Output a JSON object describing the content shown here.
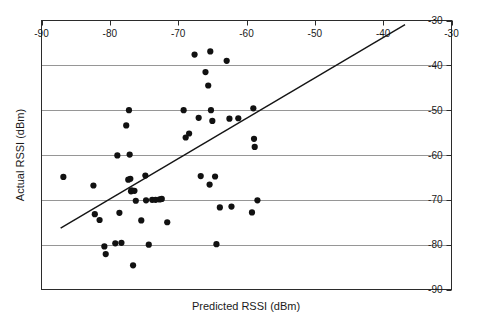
{
  "chart_data": {
    "type": "scatter",
    "title": "",
    "xlabel": "Predicted RSSI (dBm)",
    "ylabel": "Actual RSSI (dBm)",
    "xlim": [
      -90,
      -30
    ],
    "ylim": [
      -90,
      -30
    ],
    "xticks": [
      -90,
      -80,
      -70,
      -60,
      -50,
      -40,
      -30
    ],
    "xtick_labels": [
      "-90",
      "-80",
      "-70",
      "-60",
      "-50",
      "-40",
      "-30"
    ],
    "yticks": [
      -30,
      -40,
      -50,
      -60,
      -70,
      -80,
      -90
    ],
    "ytick_labels": [
      "-30",
      "-40",
      "-50",
      "-60",
      "-70",
      "-80",
      "-90"
    ],
    "xaxis_position": "top",
    "yaxis_position": "right",
    "grid": "horizontal",
    "grid_color": "#8a8a8a",
    "frame_color": "#2b2b2b",
    "marker_color": "#111111",
    "marker_shape": "circle",
    "marker_size": 3.1,
    "legend": null,
    "series": [
      {
        "name": "RSSI samples",
        "x": [
          -86.8,
          -82.4,
          -82.2,
          -81.5,
          -80.8,
          -80.6,
          -79.2,
          -78.9,
          -78.6,
          -78.3,
          -77.6,
          -77.3,
          -77.2,
          -77.1,
          -77.0,
          -76.9,
          -76.8,
          -76.6,
          -76.4,
          -76.2,
          -75.4,
          -74.8,
          -74.7,
          -74.3,
          -73.8,
          -73.3,
          -72.7,
          -72.4,
          -71.6,
          -69.2,
          -68.9,
          -68.4,
          -67.6,
          -67.0,
          -66.7,
          -66.0,
          -65.6,
          -65.4,
          -65.3,
          -65.2,
          -65.0,
          -64.6,
          -64.4,
          -63.9,
          -62.9,
          -62.5,
          -62.2,
          -61.2,
          -59.2,
          -59.0,
          -58.9,
          -58.8,
          -58.4
        ],
        "y": [
          -64.9,
          -66.8,
          -73.2,
          -74.5,
          -80.4,
          -82.1,
          -79.7,
          -60.1,
          -72.9,
          -79.6,
          -53.4,
          -65.5,
          -50.0,
          -59.9,
          -65.3,
          -68.1,
          -67.9,
          -84.6,
          -68.0,
          -70.2,
          -74.6,
          -64.6,
          -70.1,
          -80.0,
          -70.0,
          -70.0,
          -69.9,
          -69.8,
          -75.0,
          -50.0,
          -56.1,
          -55.2,
          -37.6,
          -51.7,
          -64.7,
          -41.5,
          -44.5,
          -66.6,
          -36.9,
          -50.0,
          -52.4,
          -64.8,
          -79.9,
          -71.7,
          -39.0,
          -51.9,
          -71.5,
          -51.8,
          -72.8,
          -49.6,
          -56.4,
          -58.2,
          -70.1
        ]
      }
    ],
    "fit_line": {
      "name": "linear fit",
      "x": [
        -87.2,
        -36.8
      ],
      "y": [
        -76.3,
        -30.9
      ],
      "color": "#151515"
    }
  },
  "axis": {
    "x_title": "Predicted RSSI (dBm)",
    "y_title": "Actual RSSI (dBm)"
  }
}
